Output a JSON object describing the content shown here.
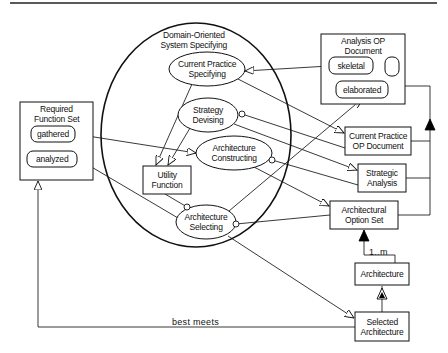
{
  "diagram": {
    "top_rule": {
      "x1": 10,
      "y1": 3,
      "x2": 437,
      "y2": 3
    },
    "container": {
      "id": "domain-oriented-system-specifying",
      "label_lines": [
        "Domain-Oriented",
        "System Specifying"
      ],
      "cx": 196,
      "cy": 135,
      "rx": 95,
      "ry": 112
    },
    "activities": [
      {
        "id": "current-practice-specifying",
        "lines": [
          "Current Practice",
          "Specifying"
        ],
        "cx": 207,
        "cy": 69,
        "rx": 38,
        "ry": 17
      },
      {
        "id": "strategy-devising",
        "lines": [
          "Strategy",
          "Devising"
        ],
        "cx": 208,
        "cy": 115,
        "rx": 30,
        "ry": 17
      },
      {
        "id": "architecture-constructing",
        "lines": [
          "Architecture",
          "Constructing"
        ],
        "cx": 234,
        "cy": 153,
        "rx": 38,
        "ry": 17
      },
      {
        "id": "architecture-selecting",
        "lines": [
          "Architecture",
          "Selecting"
        ],
        "cx": 206,
        "cy": 222,
        "rx": 30,
        "ry": 17
      }
    ],
    "boxes": [
      {
        "id": "required-function-set",
        "title_lines": [
          "Required",
          "Function Set"
        ],
        "x": 20,
        "y": 102,
        "w": 73,
        "h": 78
      },
      {
        "id": "analysis-op-document",
        "title_lines": [
          "Analysis OP",
          "Document"
        ],
        "x": 321,
        "y": 34,
        "w": 84,
        "h": 70
      },
      {
        "id": "utility-function",
        "title_lines": [
          "Utility",
          "Function"
        ],
        "x": 143,
        "y": 166,
        "w": 48,
        "h": 28
      },
      {
        "id": "current-practice-op-document",
        "title_lines": [
          "Current Practice",
          "OP Document"
        ],
        "x": 345,
        "y": 127,
        "w": 66,
        "h": 28
      },
      {
        "id": "strategic-analysis",
        "title_lines": [
          "Strategic",
          "Analysis"
        ],
        "x": 358,
        "y": 164,
        "w": 48,
        "h": 28
      },
      {
        "id": "architectural-option-set",
        "title_lines": [
          "Architectural",
          "Option Set"
        ],
        "x": 330,
        "y": 201,
        "w": 68,
        "h": 28
      },
      {
        "id": "architecture",
        "title_lines": [
          "Architecture"
        ],
        "x": 355,
        "y": 263,
        "w": 54,
        "h": 22
      },
      {
        "id": "selected-architecture",
        "title_lines": [
          "Selected",
          "Architecture"
        ],
        "x": 355,
        "y": 312,
        "w": 54,
        "h": 29
      }
    ],
    "states": [
      {
        "id": "gathered",
        "label": "gathered",
        "x": 31,
        "y": 126,
        "w": 44,
        "h": 16
      },
      {
        "id": "analyzed",
        "label": "analyzed",
        "x": 27,
        "y": 151,
        "w": 50,
        "h": 16
      },
      {
        "id": "skeletal",
        "label": "skeletal",
        "x": 329,
        "y": 57,
        "w": 44,
        "h": 17
      },
      {
        "id": "unnamed-state",
        "label": "",
        "x": 385,
        "y": 57,
        "w": 14,
        "h": 19
      },
      {
        "id": "elaborated",
        "label": "elaborated",
        "x": 336,
        "y": 81,
        "w": 52,
        "h": 17
      }
    ],
    "edges": [
      {
        "id": "gathered-to-constructing",
        "points": [
          [
            75,
            134
          ],
          [
            196,
            153
          ]
        ],
        "end": "open-arrow"
      },
      {
        "id": "selecting-to-analyzed",
        "points": [
          [
            178,
            218
          ],
          [
            78,
            159
          ]
        ],
        "end": "open-arrow"
      },
      {
        "id": "skeletal-to-cps",
        "points": [
          [
            329,
            66
          ],
          [
            245,
            71
          ]
        ],
        "end": "open-arrow"
      },
      {
        "id": "cps-to-cpopdoc",
        "points": [
          [
            238,
            79
          ],
          [
            344,
            133
          ]
        ],
        "end": "open-arrow"
      },
      {
        "id": "cps-to-utility",
        "points": [
          [
            192,
            84
          ],
          [
            156,
            165
          ]
        ],
        "end": "open-arrow"
      },
      {
        "id": "strategy-to-utility",
        "points": [
          [
            190,
            128
          ],
          [
            168,
            165
          ]
        ],
        "end": "open-arrow"
      },
      {
        "id": "strategy-to-cpopdoc",
        "points": [
          [
            242,
            114
          ],
          [
            345,
            148
          ]
        ],
        "start": "circle"
      },
      {
        "id": "strategy-to-strategic",
        "points": [
          [
            234,
            124
          ],
          [
            357,
            170
          ]
        ],
        "end": "open-arrow"
      },
      {
        "id": "constructing-to-strategic",
        "points": [
          [
            272,
            160
          ],
          [
            358,
            185
          ]
        ],
        "start": "circle"
      },
      {
        "id": "constructing-to-optionset",
        "points": [
          [
            254,
            167
          ],
          [
            329,
            206
          ]
        ],
        "end": "open-arrow"
      },
      {
        "id": "utility-to-selecting",
        "points": [
          [
            165,
            194
          ],
          [
            187,
            207
          ]
        ],
        "end": "circle"
      },
      {
        "id": "selecting-to-elaborated",
        "points": [
          [
            229,
            211
          ],
          [
            362,
            99
          ]
        ],
        "end": "open-arrow"
      },
      {
        "id": "optionset-to-selecting",
        "points": [
          [
            330,
            215
          ],
          [
            236,
            224
          ]
        ],
        "end": "circle"
      },
      {
        "id": "selecting-to-selected",
        "points": [
          [
            228,
            236
          ],
          [
            354,
            318
          ]
        ],
        "end": "open-arrow"
      },
      {
        "id": "analysis-doc-to-composite",
        "points": [
          [
            405,
            86
          ],
          [
            430,
            86
          ],
          [
            430,
            215
          ],
          [
            398,
            215
          ]
        ]
      },
      {
        "id": "cpopdoc-to-composite",
        "points": [
          [
            411,
            141
          ],
          [
            430,
            141
          ]
        ]
      },
      {
        "id": "strategic-to-composite",
        "points": [
          [
            406,
            178
          ],
          [
            430,
            178
          ]
        ]
      },
      {
        "id": "architecture-to-optionset",
        "points": [
          [
            395,
            263
          ],
          [
            395,
            255
          ],
          [
            364,
            255
          ],
          [
            364,
            230
          ]
        ]
      },
      {
        "id": "selected-to-architecture",
        "points": [
          [
            382,
            312
          ],
          [
            382,
            286
          ]
        ]
      },
      {
        "id": "best-meets",
        "points": [
          [
            355,
            327
          ],
          [
            38,
            327
          ],
          [
            38,
            181
          ]
        ],
        "end": "open-arrow-up"
      }
    ],
    "markers": [
      {
        "id": "aggregation-triangle-right",
        "type": "filled-triangle",
        "x": 430,
        "y": 125,
        "dir": "up"
      },
      {
        "id": "aggregation-triangle-optionset",
        "type": "filled-triangle",
        "x": 364,
        "y": 236,
        "dir": "up"
      },
      {
        "id": "generalization-triangle",
        "type": "hatched-triangle",
        "x": 382,
        "y": 294,
        "dir": "up"
      }
    ],
    "edge_labels": [
      {
        "id": "multiplicity",
        "text": "1..m",
        "x": 369,
        "y": 247
      },
      {
        "id": "best-meets-label",
        "text": "best meets",
        "x": 172,
        "y": 317
      }
    ]
  }
}
